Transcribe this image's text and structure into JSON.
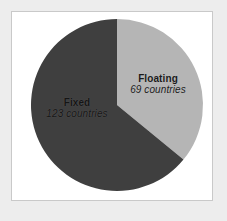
{
  "figure": {
    "background_color": "#ededed",
    "frame_color": "#c9c9c9",
    "plot_background": "#ffffff"
  },
  "chart_data": {
    "type": "pie",
    "title": "",
    "subtitle": "",
    "xlabel": "",
    "ylabel": "",
    "grid": false,
    "legend_position": "none",
    "label_style": "inside-slice",
    "unit": "countries",
    "total": 192,
    "categories": [
      "Floating",
      "Fixed"
    ],
    "values": [
      69,
      123
    ],
    "percentages": [
      35.9,
      64.1
    ],
    "colors": [
      "#b5b5b5",
      "#3f3f3f"
    ],
    "start_angle_deg": 0,
    "direction": "clockwise",
    "slices": [
      {
        "name": "Floating",
        "label": "Floating",
        "value": 69,
        "value_label": "69 countries",
        "percent": 35.9,
        "color": "#b5b5b5",
        "start_angle_deg": 0,
        "end_angle_deg": 129.4
      },
      {
        "name": "Fixed",
        "label": "Fixed",
        "value": 123,
        "value_label": "123 countries",
        "percent": 64.1,
        "color": "#3f3f3f",
        "start_angle_deg": 129.4,
        "end_angle_deg": 360
      }
    ],
    "geometry": {
      "center_x": 117,
      "center_y": 105,
      "radius": 86
    }
  }
}
